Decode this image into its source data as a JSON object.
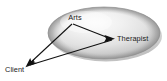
{
  "figure": {
    "background_color": "#ffffff"
  },
  "container": {
    "shape": "ellipse",
    "name": "therapeutic-space-ellipse",
    "fill_light": "#f2f2f2",
    "fill_mid": "#d8d8d8",
    "fill_dark": "#a9a9a9",
    "edge_color": "#9a9a9a",
    "center_x": 104,
    "center_y": 33,
    "radius_x": 56,
    "radius_y": 26
  },
  "nodes": [
    {
      "id": "arts",
      "label": "Arts",
      "x": 75,
      "y": 18,
      "anchor": "middle",
      "inside_container": true
    },
    {
      "id": "therapist",
      "label": "Therapist",
      "x": 117,
      "y": 39,
      "anchor": "start",
      "inside_container": true
    },
    {
      "id": "client",
      "label": "Client",
      "x": 5,
      "y": 70,
      "anchor": "start",
      "inside_container": false
    }
  ],
  "edges": [
    {
      "id": "arts-to-therapist",
      "from": "arts",
      "to": "therapist",
      "arrow": "end",
      "color": "#111111"
    },
    {
      "id": "arts-to-client",
      "from": "arts",
      "to": "client",
      "arrow": "end",
      "color": "#111111"
    },
    {
      "id": "therapist-to-client",
      "from": "therapist",
      "to": "client",
      "arrow": "end",
      "color": "#111111"
    }
  ]
}
